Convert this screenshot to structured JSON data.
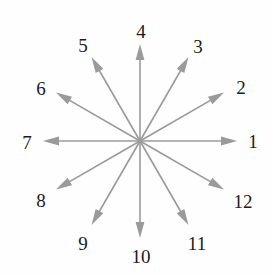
{
  "figure": {
    "title": "",
    "type": "radial-direction-diagram",
    "canvas": {
      "width": 274,
      "height": 275,
      "background": "#fefefe"
    },
    "center": {
      "x": 140,
      "y": 141
    },
    "arrow": {
      "color": "#9a9a9a",
      "shaft_width": 1.6,
      "length": 97,
      "head_length": 16,
      "head_half_width": 4.4
    },
    "label_style": {
      "color": "#1b1b1b",
      "font_size": 19,
      "radius": 116
    },
    "spokes": [
      {
        "label": "1",
        "angle_deg": 0,
        "label_x": 253,
        "label_y": 141
      },
      {
        "label": "2",
        "angle_deg": 30,
        "label_x": 241,
        "label_y": 87
      },
      {
        "label": "3",
        "angle_deg": 60,
        "label_x": 198,
        "label_y": 46
      },
      {
        "label": "4",
        "angle_deg": 90,
        "label_x": 141,
        "label_y": 31
      },
      {
        "label": "5",
        "angle_deg": 120,
        "label_x": 83,
        "label_y": 45
      },
      {
        "label": "6",
        "angle_deg": 150,
        "label_x": 41,
        "label_y": 88
      },
      {
        "label": "7",
        "angle_deg": 180,
        "label_x": 27,
        "label_y": 142
      },
      {
        "label": "8",
        "angle_deg": 210,
        "label_x": 41,
        "label_y": 200
      },
      {
        "label": "9",
        "angle_deg": 240,
        "label_x": 83,
        "label_y": 243
      },
      {
        "label": "10",
        "angle_deg": 270,
        "label_x": 141,
        "label_y": 256
      },
      {
        "label": "11",
        "angle_deg": 300,
        "label_x": 197,
        "label_y": 243
      },
      {
        "label": "12",
        "angle_deg": 330,
        "label_x": 243,
        "label_y": 201
      }
    ]
  }
}
